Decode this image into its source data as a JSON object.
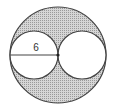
{
  "diagram": {
    "segment_label": "6",
    "colors": {
      "stroke": "#333333",
      "shade": "#c8c8c8",
      "fill": "#ffffff"
    }
  }
}
